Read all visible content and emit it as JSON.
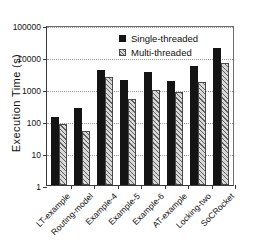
{
  "chart_data": {
    "type": "bar",
    "title": "",
    "xlabel": "",
    "ylabel": "Execution Time (s)",
    "yscale": "log",
    "ylim": [
      1,
      100000
    ],
    "yticks": [
      1,
      10,
      100,
      1000,
      10000,
      100000
    ],
    "ytick_labels": [
      "1",
      "10",
      "100",
      "1000",
      "10000",
      "100000"
    ],
    "grid": true,
    "legend_position": "upper center",
    "categories": [
      "LT-example",
      "Routing-model",
      "Example-4",
      "Example-5",
      "Example-6",
      "AT-example",
      "Locking-two",
      "SoCRocket"
    ],
    "series": [
      {
        "name": "Single-threaded",
        "color": "#141414",
        "pattern": "solid",
        "values": [
          130,
          250,
          4000,
          1900,
          3300,
          1750,
          5200,
          19000
        ]
      },
      {
        "name": "Multi-threaded",
        "color": "#d8d8d8",
        "pattern": "diagonal-hatch",
        "values": [
          80,
          50,
          2300,
          480,
          950,
          780,
          1700,
          6300
        ]
      }
    ]
  }
}
